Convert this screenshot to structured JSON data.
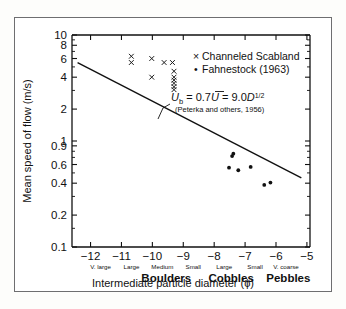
{
  "chart_data": {
    "type": "scatter",
    "title": "",
    "xlabel": "Intermediate particle diameter (ϕ)",
    "ylabel": "Mean speed of flow (m/s)",
    "xlim": [
      -12.6,
      -4.9
    ],
    "ylim": [
      0.1,
      10
    ],
    "yscale": "log",
    "xscale": "linear",
    "grid": false,
    "legend_position": "upper-right-inside",
    "y_ticks": [
      {
        "value": 10,
        "label": "10"
      },
      {
        "value": 8,
        "label": "8"
      },
      {
        "value": 6,
        "label": "6"
      },
      {
        "value": 4,
        "label": "4"
      },
      {
        "value": 2,
        "label": "2"
      },
      {
        "value": 1,
        "label": "1"
      },
      {
        "value": 0.9,
        "label": "0.9"
      },
      {
        "value": 0.6,
        "label": "0.6"
      },
      {
        "value": 0.4,
        "label": "0.4"
      },
      {
        "value": 0.2,
        "label": "0.2"
      },
      {
        "value": 0.1,
        "label": "0.1"
      }
    ],
    "x_ticks": [
      {
        "value": -12,
        "label": "−12",
        "sub": "V. large"
      },
      {
        "value": -11,
        "label": "−11",
        "sub": "Large"
      },
      {
        "value": -10,
        "label": "−10",
        "sub": "Medium"
      },
      {
        "value": -9,
        "label": "−9",
        "sub": "Small"
      },
      {
        "value": -8,
        "label": "−8",
        "sub": "Large"
      },
      {
        "value": -7,
        "label": "−7",
        "sub": "Small"
      },
      {
        "value": -6,
        "label": "−6",
        "sub": "V. coarse"
      },
      {
        "value": -5,
        "label": "−5",
        "sub": ""
      }
    ],
    "size_classes": [
      {
        "label": "Boulders",
        "center": -9.55
      },
      {
        "label": "Cobbles",
        "center": -7.45
      },
      {
        "label": "Pebbles",
        "center": -5.6
      }
    ],
    "series": [
      {
        "name": "Channeled Scabland",
        "marker": "x",
        "points": [
          {
            "x": -10.68,
            "y": 6.3
          },
          {
            "x": -10.68,
            "y": 5.5
          },
          {
            "x": -10.02,
            "y": 6.0
          },
          {
            "x": -9.62,
            "y": 5.5
          },
          {
            "x": -9.35,
            "y": 5.5
          },
          {
            "x": -10.02,
            "y": 4.0
          },
          {
            "x": -9.3,
            "y": 4.55
          },
          {
            "x": -9.3,
            "y": 4.0
          },
          {
            "x": -9.3,
            "y": 3.75
          },
          {
            "x": -9.3,
            "y": 3.5
          },
          {
            "x": -9.3,
            "y": 3.25
          },
          {
            "x": -9.3,
            "y": 3.05
          }
        ]
      },
      {
        "name": "Fahnestock (1963)",
        "marker": "dot",
        "points": [
          {
            "x": -7.38,
            "y": 0.76
          },
          {
            "x": -7.42,
            "y": 0.72
          },
          {
            "x": -7.52,
            "y": 0.56
          },
          {
            "x": -7.22,
            "y": 0.53
          },
          {
            "x": -6.82,
            "y": 0.57
          },
          {
            "x": -6.38,
            "y": 0.385
          },
          {
            "x": -6.18,
            "y": 0.405
          }
        ]
      }
    ],
    "trend_line": {
      "label": "Peterka curve",
      "x_start": -12.42,
      "y_start": 5.5,
      "x_end": -5.18,
      "y_end": 0.45
    },
    "annotation": {
      "equation_parts": {
        "u_symbol": "U",
        "u_subscript": "b",
        "equals_one": " = ",
        "coefficient": "0.7",
        "u_bar": "U",
        "equals_two": " = ",
        "value": "9.0",
        "d_symbol": "D",
        "exponent": "1/2"
      },
      "equation_plain": "Ub = 0.7Ū = 9.0D1/2",
      "citation": "(Peterka and others, 1956)"
    },
    "legend_entries": [
      {
        "marker": "x",
        "label": "Channeled Scabland"
      },
      {
        "marker": "dot",
        "label": "Fahnestock (1963)"
      }
    ]
  },
  "colors": {
    "ink": "#111111",
    "frame": "#6e6e70",
    "background": "#ffffff"
  }
}
